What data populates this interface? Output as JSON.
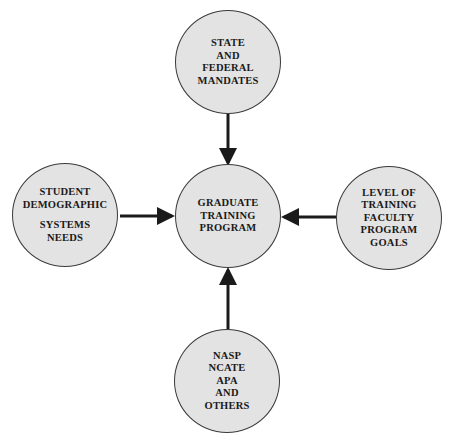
{
  "diagram": {
    "type": "hub-and-spoke",
    "center": {
      "id": "center",
      "lines": [
        "GRADUATE",
        "TRAINING",
        "PROGRAM"
      ]
    },
    "nodes": {
      "top": {
        "lines": [
          "STATE",
          "AND",
          "FEDERAL",
          "MANDATES"
        ]
      },
      "left": {
        "lines_a": [
          "STUDENT",
          "DEMOGRAPHIC"
        ],
        "lines_b": [
          "SYSTEMS",
          "NEEDS"
        ]
      },
      "right": {
        "lines": [
          "LEVEL OF",
          "TRAINING",
          "FACULTY",
          "PROGRAM",
          "GOALS"
        ]
      },
      "bottom": {
        "lines": [
          "NASP",
          "NCATE",
          "APA",
          "AND",
          "OTHERS"
        ]
      }
    },
    "edges": [
      {
        "from": "top",
        "to": "center"
      },
      {
        "from": "left",
        "to": "center"
      },
      {
        "from": "right",
        "to": "center"
      },
      {
        "from": "bottom",
        "to": "center"
      }
    ],
    "colors": {
      "node_fill": "#e3e3e3",
      "stroke": "#1a1a1a"
    }
  }
}
